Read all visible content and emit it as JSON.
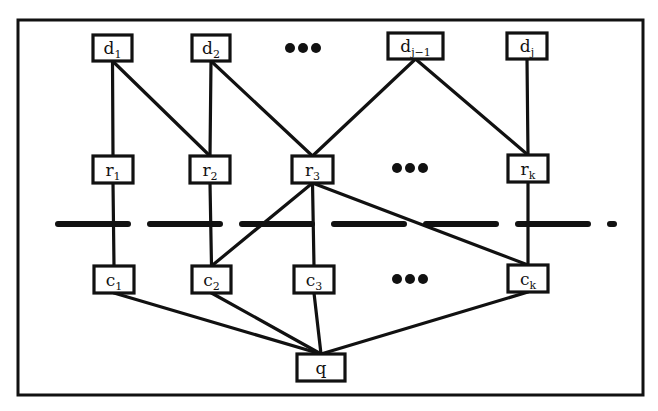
{
  "diagram": {
    "type": "layered-graph",
    "colors": {
      "ink": "#111111",
      "background": "#ffffff"
    },
    "frame": {
      "x": 18,
      "y": 20,
      "width": 625,
      "height": 375
    },
    "separator": {
      "style": "dashed",
      "y": 224,
      "x1": 58,
      "x2": 614
    },
    "layers": [
      {
        "id": "d",
        "nodes": [
          {
            "id": "d1",
            "base": "d",
            "sub": "1",
            "x": 93,
            "y": 35,
            "w": 39,
            "h": 26
          },
          {
            "id": "d2",
            "base": "d",
            "sub": "2",
            "x": 192,
            "y": 35,
            "w": 38,
            "h": 26
          },
          {
            "id": "d_i-1",
            "base": "d",
            "sub": "j−1",
            "x": 388,
            "y": 33,
            "w": 55,
            "h": 26
          },
          {
            "id": "d_i",
            "base": "d",
            "sub": "j",
            "x": 507,
            "y": 33,
            "w": 40,
            "h": 26
          }
        ],
        "ellipsis": {
          "label": "•••",
          "x": 303,
          "y": 48
        }
      },
      {
        "id": "r",
        "nodes": [
          {
            "id": "r1",
            "base": "r",
            "sub": "1",
            "x": 93,
            "y": 156,
            "w": 40,
            "h": 27
          },
          {
            "id": "r2",
            "base": "r",
            "sub": "2",
            "x": 190,
            "y": 156,
            "w": 40,
            "h": 27
          },
          {
            "id": "r3",
            "base": "r",
            "sub": "3",
            "x": 292,
            "y": 156,
            "w": 41,
            "h": 27
          },
          {
            "id": "r_k",
            "base": "r",
            "sub": "k",
            "x": 508,
            "y": 155,
            "w": 40,
            "h": 27
          }
        ],
        "ellipsis": {
          "label": "•••",
          "x": 410,
          "y": 168
        }
      },
      {
        "id": "c",
        "nodes": [
          {
            "id": "c1",
            "base": "c",
            "sub": "1",
            "x": 94,
            "y": 266,
            "w": 40,
            "h": 27
          },
          {
            "id": "c2",
            "base": "c",
            "sub": "2",
            "x": 192,
            "y": 266,
            "w": 39,
            "h": 27
          },
          {
            "id": "c3",
            "base": "c",
            "sub": "3",
            "x": 294,
            "y": 266,
            "w": 40,
            "h": 27
          },
          {
            "id": "c_k",
            "base": "c",
            "sub": "k",
            "x": 508,
            "y": 265,
            "w": 40,
            "h": 27
          }
        ],
        "ellipsis": {
          "label": "•••",
          "x": 410,
          "y": 279
        }
      },
      {
        "id": "q",
        "nodes": [
          {
            "id": "q",
            "base": "q",
            "sub": "",
            "x": 297,
            "y": 354,
            "w": 48,
            "h": 27
          }
        ]
      }
    ],
    "edges": [
      [
        "d1",
        "r1"
      ],
      [
        "d1",
        "r2"
      ],
      [
        "d2",
        "r2"
      ],
      [
        "d2",
        "r3"
      ],
      [
        "d_i-1",
        "r3"
      ],
      [
        "d_i-1",
        "r_k"
      ],
      [
        "d_i",
        "r_k"
      ],
      [
        "r1",
        "c1"
      ],
      [
        "r2",
        "c2"
      ],
      [
        "r3",
        "c2"
      ],
      [
        "r3",
        "c3"
      ],
      [
        "r3",
        "c_k"
      ],
      [
        "r_k",
        "c_k"
      ],
      [
        "c1",
        "q"
      ],
      [
        "c2",
        "q"
      ],
      [
        "c3",
        "q"
      ],
      [
        "c_k",
        "q"
      ]
    ]
  }
}
